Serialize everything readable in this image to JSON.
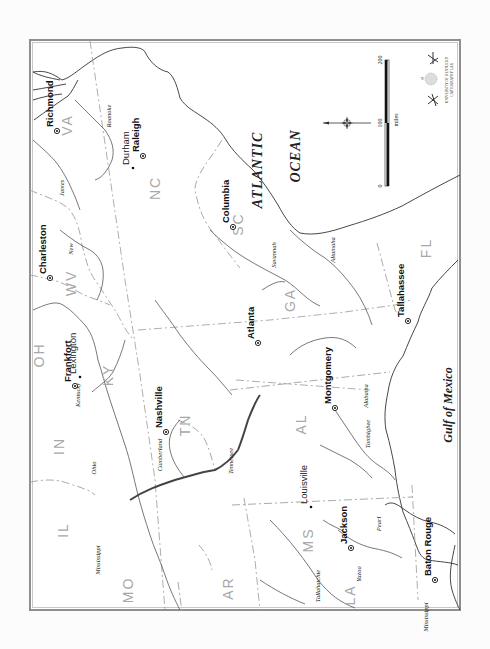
{
  "map": {
    "orientation": "rotated 90 degrees counterclockwise",
    "water_labels": {
      "ocean_line1": "ATLANTIC",
      "ocean_line2": "OCEAN",
      "gulf": "Gulf of Mexico"
    },
    "states": [
      {
        "abbr": "VA",
        "x": 72,
        "y": 125
      },
      {
        "abbr": "NC",
        "x": 160,
        "y": 188
      },
      {
        "abbr": "SC",
        "x": 243,
        "y": 224
      },
      {
        "abbr": "WV",
        "x": 76,
        "y": 283
      },
      {
        "abbr": "OH",
        "x": 44,
        "y": 355
      },
      {
        "abbr": "KY",
        "x": 113,
        "y": 375
      },
      {
        "abbr": "GA",
        "x": 295,
        "y": 300
      },
      {
        "abbr": "FL",
        "x": 431,
        "y": 248
      },
      {
        "abbr": "TN",
        "x": 190,
        "y": 425
      },
      {
        "abbr": "IN",
        "x": 64,
        "y": 446
      },
      {
        "abbr": "AL",
        "x": 306,
        "y": 424
      },
      {
        "abbr": "IL",
        "x": 68,
        "y": 530
      },
      {
        "abbr": "MS",
        "x": 313,
        "y": 540
      },
      {
        "abbr": "MO",
        "x": 133,
        "y": 590
      },
      {
        "abbr": "AR",
        "x": 233,
        "y": 588
      },
      {
        "abbr": "LA",
        "x": 355,
        "y": 595
      }
    ],
    "capitals": [
      {
        "name": "Richmond",
        "x": 57,
        "y": 131
      },
      {
        "name": "Raleigh",
        "x": 143,
        "y": 156
      },
      {
        "name": "Columbia",
        "x": 233,
        "y": 227
      },
      {
        "name": "Charleston",
        "x": 50,
        "y": 278
      },
      {
        "name": "Frankfort",
        "x": 75,
        "y": 386
      },
      {
        "name": "Atlanta",
        "x": 258,
        "y": 343
      },
      {
        "name": "Tallahassee",
        "x": 408,
        "y": 321
      },
      {
        "name": "Nashville",
        "x": 166,
        "y": 432
      },
      {
        "name": "Montgomery",
        "x": 335,
        "y": 408
      },
      {
        "name": "Jackson",
        "x": 351,
        "y": 548
      },
      {
        "name": "Baton Rouge",
        "x": 435,
        "y": 580
      }
    ],
    "towns": [
      {
        "name": "Durham",
        "x": 133,
        "y": 168
      },
      {
        "name": "Lexington",
        "x": 80,
        "y": 377
      },
      {
        "name": "Louisville",
        "x": 311,
        "y": 507
      }
    ],
    "rivers": [
      {
        "name": "James",
        "x": 64,
        "y": 188
      },
      {
        "name": "Roanoke",
        "x": 111,
        "y": 116
      },
      {
        "name": "New",
        "x": 73,
        "y": 249
      },
      {
        "name": "Kentucky",
        "x": 80,
        "y": 395
      },
      {
        "name": "Savannah",
        "x": 276,
        "y": 255
      },
      {
        "name": "Altamaha",
        "x": 335,
        "y": 250
      },
      {
        "name": "Cumberland",
        "x": 162,
        "y": 455
      },
      {
        "name": "Tennessee",
        "x": 233,
        "y": 461
      },
      {
        "name": "Ohio",
        "x": 96,
        "y": 468
      },
      {
        "name": "Mississippi",
        "x": 100,
        "y": 560
      },
      {
        "name": "Alabama",
        "x": 368,
        "y": 396
      },
      {
        "name": "Tombigbee",
        "x": 370,
        "y": 434
      },
      {
        "name": "Tallahatchie",
        "x": 320,
        "y": 586
      },
      {
        "name": "Yazoo",
        "x": 361,
        "y": 574
      },
      {
        "name": "Pearl",
        "x": 381,
        "y": 524
      },
      {
        "name": "Mississippi",
        "x": 428,
        "y": 617
      }
    ],
    "scale_bar": {
      "unit": "miles",
      "ticks": [
        "0",
        "100",
        "200"
      ]
    },
    "credit": {
      "line1": "UNIVERSITY OF KENTUCKY",
      "line2": "CARTOGRAPHY LAB"
    },
    "compass_label": "N"
  }
}
